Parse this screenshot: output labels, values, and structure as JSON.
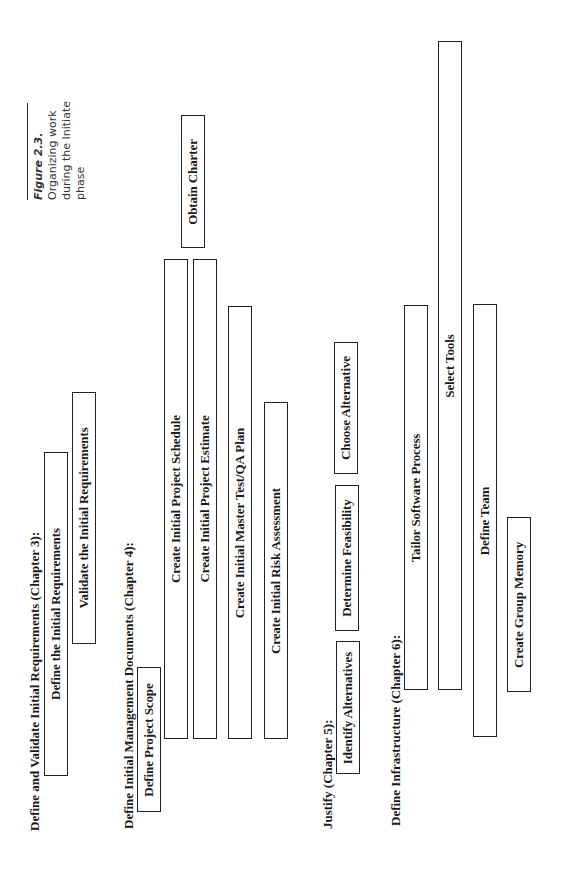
{
  "caption": {
    "figure_label": "Figure 2.3.",
    "lines": [
      "Organizing work",
      "during the Initiate",
      "phase"
    ]
  },
  "groups": [
    {
      "heading": "Define and Validate Initial Requirements (Chapter 3):",
      "tasks": [
        "Define the Initial Requirements",
        "Validate the Initial Requirements"
      ]
    },
    {
      "heading": "Define Initial Management Documents (Chapter 4):",
      "tasks": [
        "Define Project Scope",
        "Create Initial Project Schedule",
        "Create Initial Project Estimate",
        "Obtain Charter",
        "Create Initial Master Test/QA Plan",
        "Create Initial Risk Assessment"
      ]
    },
    {
      "heading": "Justify (Chapter 5):",
      "tasks": [
        "Identify Alternatives",
        "Determine Feasibility",
        "Choose Alternative"
      ]
    },
    {
      "heading": "Define Infrastructure (Chapter 6):",
      "tasks": [
        "Tailor Software Process",
        "Select Tools",
        "Define Team",
        "Create Group Memory"
      ]
    }
  ]
}
